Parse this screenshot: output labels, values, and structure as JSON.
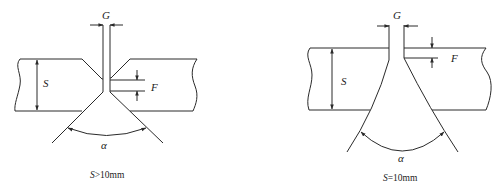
{
  "figures": [
    {
      "id": "left",
      "title": "Double-V groove weld joint, thick plate",
      "labels": {
        "gap": "G",
        "thickness": "S",
        "root_face": "F",
        "angle": "α"
      },
      "caption": {
        "var": "S",
        "rest": ">10mm"
      }
    },
    {
      "id": "right",
      "title": "U-shaped groove weld joint",
      "labels": {
        "gap": "G",
        "thickness": "S",
        "root_face": "F",
        "angle": "α"
      },
      "caption": {
        "var": "S",
        "rest": "=10mm"
      }
    }
  ],
  "colors": {
    "line": "#2a2a2a",
    "background": "#ffffff"
  }
}
